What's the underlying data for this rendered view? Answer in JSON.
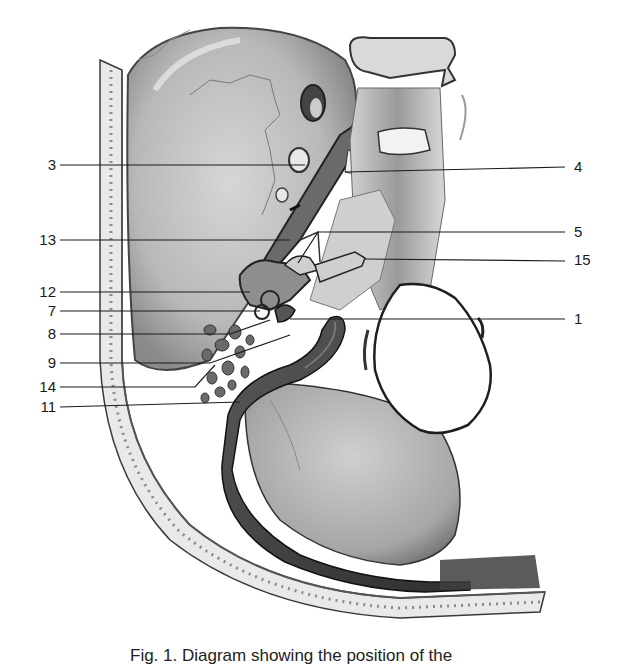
{
  "figure": {
    "type": "anatomical illustration",
    "colors": {
      "ink": "#1a1a1a",
      "bone_light": "#e6e6e6",
      "bone_mid": "#bdbdbd",
      "bone_dark": "#6e6e6e",
      "sinus": "#4a4a4a",
      "background": "#ffffff"
    }
  },
  "labels": {
    "left": [
      {
        "id": "3",
        "text": "3",
        "y": 165
      },
      {
        "id": "13",
        "text": "13",
        "y": 240
      },
      {
        "id": "12",
        "text": "12",
        "y": 292
      },
      {
        "id": "7",
        "text": "7",
        "y": 311
      },
      {
        "id": "8",
        "text": "8",
        "y": 334
      },
      {
        "id": "9",
        "text": "9",
        "y": 363
      },
      {
        "id": "14",
        "text": "14",
        "y": 387
      },
      {
        "id": "11",
        "text": "11",
        "y": 407
      }
    ],
    "right": [
      {
        "id": "4",
        "text": "4",
        "y": 167
      },
      {
        "id": "5",
        "text": "5",
        "y": 232
      },
      {
        "id": "15",
        "text": "15",
        "y": 260
      },
      {
        "id": "1",
        "text": "1",
        "y": 319
      }
    ]
  },
  "caption": {
    "text": "Fig. 1.   Diagram showing the position of the"
  }
}
